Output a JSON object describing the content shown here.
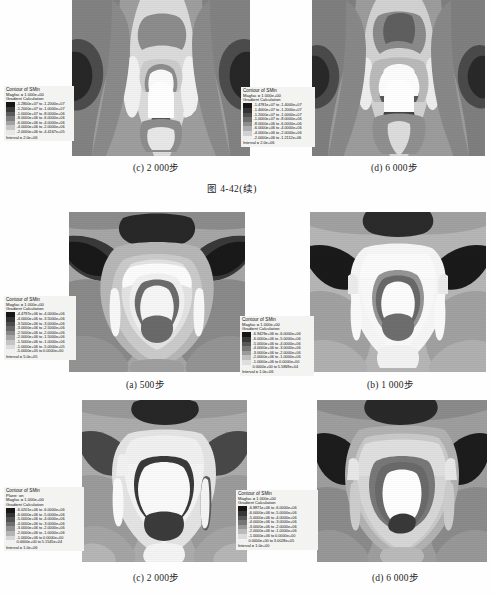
{
  "page": {
    "figure_number": "图 4-42(续)",
    "legend_title": "Contour of SMin",
    "legend_gradient_line": "Gradient Calculation",
    "legend_magfac_prefix": "Magfac =",
    "legend_plane_line": "Plane: on",
    "legend_interval_prefix": "Interval ="
  },
  "panels": [
    {
      "id": "top-c",
      "caption": "(c) 2 000步",
      "legend": {
        "title": "Contour of SMin",
        "magfac": "Magfac =  1.000e+00",
        "mode": "Gradient Calculation",
        "plane": null,
        "rows": [
          {
            "color": "#161616",
            "label": "-1.2800e+07 to -1.2000e+07"
          },
          {
            "color": "#3a3a3a",
            "label": "-1.2000e+07 to -1.0000e+07"
          },
          {
            "color": "#5d5d5d",
            "label": "-1.0000e+07 to -8.0000e+06"
          },
          {
            "color": "#7f7f7f",
            "label": "-8.0000e+06 to -6.0000e+06"
          },
          {
            "color": "#a2a2a2",
            "label": "-6.0000e+06 to -4.0000e+06"
          },
          {
            "color": "#c6c6c6",
            "label": "-4.0000e+06 to -2.0000e+06"
          },
          {
            "color": "#e8e8e8",
            "label": "-2.0000e+06 to -4.4167e+05"
          }
        ],
        "interval": "Interval =  2.0e+06"
      }
    },
    {
      "id": "top-d",
      "caption": "(d) 6 000步",
      "legend": {
        "title": "Contour of SMin",
        "magfac": "Magfac =  1.000e+00",
        "mode": "Gradient Calculation",
        "plane": null,
        "rows": [
          {
            "color": "#161616",
            "label": "-1.4781e+07 to -1.4000e+07"
          },
          {
            "color": "#333333",
            "label": "-1.4000e+07 to -1.2000e+07"
          },
          {
            "color": "#4f4f4f",
            "label": "-1.2000e+07 to -1.0000e+07"
          },
          {
            "color": "#6d6d6d",
            "label": "-1.0000e+07 to -8.0000e+06"
          },
          {
            "color": "#8d8d8d",
            "label": "-8.0000e+06 to -6.0000e+06"
          },
          {
            "color": "#aeaeae",
            "label": "-6.0000e+06 to -4.0000e+06"
          },
          {
            "color": "#d0d0d0",
            "label": "-4.0000e+06 to -2.0000e+06"
          },
          {
            "color": "#eeeeee",
            "label": "-2.0000e+06 to -1.2112e+06"
          }
        ],
        "interval": "Interval =  2.0e+06"
      }
    },
    {
      "id": "mid-a",
      "caption": "(a) 500步",
      "legend": {
        "title": "Contour of SMin",
        "magfac": "Magfac =  1.000e+00",
        "mode": "Gradient Calculation",
        "plane": null,
        "rows": [
          {
            "color": "#161616",
            "label": "-4.4797e+06 to -4.0000e+06"
          },
          {
            "color": "#333333",
            "label": "-4.0000e+06 to -3.5000e+06"
          },
          {
            "color": "#4d4d4d",
            "label": "-3.5000e+06 to -3.0000e+06"
          },
          {
            "color": "#676767",
            "label": "-3.0000e+06 to -2.5000e+06"
          },
          {
            "color": "#888888",
            "label": "-2.5000e+06 to -2.0000e+06"
          },
          {
            "color": "#a6a6a6",
            "label": "-2.0000e+06 to -1.5000e+06"
          },
          {
            "color": "#c4c4c4",
            "label": "-1.5000e+06 to -1.0000e+06"
          },
          {
            "color": "#dddddd",
            "label": "-1.0000e+06 to -5.0000e+05"
          },
          {
            "color": "#f0f0f0",
            "label": "-5.0000e+05 to  0.0000e+00"
          }
        ],
        "interval": "Interval =  5.0e+05"
      }
    },
    {
      "id": "mid-b",
      "caption": "(b) 1 000步",
      "legend": {
        "title": "Contour of SMin",
        "magfac": "Magfac =  1.000e+00",
        "mode": "Gradient Calculation",
        "plane": null,
        "rows": [
          {
            "color": "#161616",
            "label": "-6.9429e+06 to -6.0000e+06"
          },
          {
            "color": "#383838",
            "label": "-6.0000e+06 to -5.0000e+06"
          },
          {
            "color": "#575757",
            "label": "-5.0000e+06 to -4.0000e+06"
          },
          {
            "color": "#787878",
            "label": "-4.0000e+06 to -3.0000e+06"
          },
          {
            "color": "#9b9b9b",
            "label": "-3.0000e+06 to -2.0000e+06"
          },
          {
            "color": "#bfbfbf",
            "label": "-2.0000e+06 to -1.0000e+06"
          },
          {
            "color": "#dedede",
            "label": "-1.0000e+06 to  0.0000e+00"
          },
          {
            "color": "#f2f2f2",
            "label": " 0.0000e+00 to  5.5869e+04"
          }
        ],
        "interval": "Interval =  1.0e+06"
      }
    },
    {
      "id": "bot-c",
      "caption": "(c) 2 000步",
      "legend": {
        "title": "Contour of SMin",
        "magfac": "Magfac =  1.000e+00",
        "mode": "Gradient Calculation",
        "plane": "Plane: on",
        "rows": [
          {
            "color": "#161616",
            "label": "-6.0201e+06 to -6.0000e+06"
          },
          {
            "color": "#343434",
            "label": "-6.0000e+06 to -5.0000e+06"
          },
          {
            "color": "#515151",
            "label": "-5.0000e+06 to -4.0000e+06"
          },
          {
            "color": "#707070",
            "label": "-4.0000e+06 to -3.0000e+06"
          },
          {
            "color": "#919191",
            "label": "-3.0000e+06 to -2.0000e+06"
          },
          {
            "color": "#b4b4b4",
            "label": "-2.0000e+06 to -1.0000e+06"
          },
          {
            "color": "#d6d6d6",
            "label": "-1.0000e+06 to  0.0000e+00"
          },
          {
            "color": "#f1f1f1",
            "label": " 0.0000e+00 to  5.1545e+04"
          }
        ],
        "interval": "Interval =  1.0e+06"
      }
    },
    {
      "id": "bot-d",
      "caption": "(d) 6 000步",
      "legend": {
        "title": "Contour of SMin",
        "magfac": "Magfac =  1.000e+00",
        "mode": "Gradient Calculation",
        "plane": null,
        "rows": [
          {
            "color": "#161616",
            "label": "-6.8871e+06 to -6.0000e+06"
          },
          {
            "color": "#373737",
            "label": "-6.0000e+06 to -5.0000e+06"
          },
          {
            "color": "#565656",
            "label": "-5.0000e+06 to -4.0000e+06"
          },
          {
            "color": "#767676",
            "label": "-4.0000e+06 to -3.0000e+06"
          },
          {
            "color": "#989898",
            "label": "-3.0000e+06 to -2.0000e+06"
          },
          {
            "color": "#bababa",
            "label": "-2.0000e+06 to -1.0000e+06"
          },
          {
            "color": "#dbdbdb",
            "label": "-1.0000e+06 to  0.0000e+00"
          },
          {
            "color": "#f1f1f1",
            "label": " 0.0000e+00 to  3.0028e+05"
          }
        ],
        "interval": "Interval =  1.0e+00"
      }
    }
  ]
}
